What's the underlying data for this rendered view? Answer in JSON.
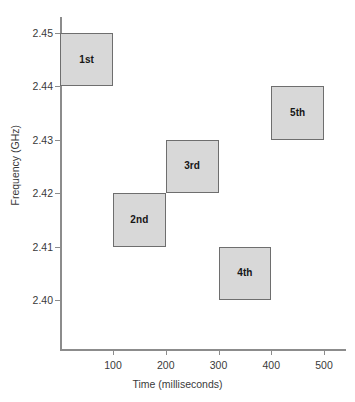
{
  "chart_data": {
    "type": "bar",
    "title": "",
    "xlabel": "Time (milliseconds)",
    "ylabel": "Frequency (GHz)",
    "xlim": [
      0,
      538
    ],
    "ylim": [
      2.3937,
      2.4563
    ],
    "xticks": [
      100,
      200,
      300,
      400,
      500
    ],
    "xtick_labels": [
      "100",
      "200",
      "300",
      "400",
      "500"
    ],
    "yticks": [
      2.4,
      2.41,
      2.42,
      2.43,
      2.44,
      2.45
    ],
    "ytick_labels": [
      "2.40",
      "2.41",
      "2.42",
      "2.43",
      "2.44",
      "2.45"
    ],
    "grid": false,
    "legend": "none",
    "box_fill_color": "#d8d8d8",
    "box_border_color": "#6e6e6e",
    "axis_color": "#8c8c8c",
    "boxes": [
      {
        "label": "1st",
        "x_start": 0,
        "x_end": 100,
        "freq_low": 2.44,
        "freq_high": 2.45
      },
      {
        "label": "2nd",
        "x_start": 100,
        "x_end": 200,
        "freq_low": 2.41,
        "freq_high": 2.42
      },
      {
        "label": "3rd",
        "x_start": 200,
        "x_end": 300,
        "freq_low": 2.42,
        "freq_high": 2.43
      },
      {
        "label": "4th",
        "x_start": 300,
        "x_end": 400,
        "freq_low": 2.4,
        "freq_high": 2.41
      },
      {
        "label": "5th",
        "x_start": 400,
        "x_end": 500,
        "freq_low": 2.43,
        "freq_high": 2.44
      }
    ]
  }
}
